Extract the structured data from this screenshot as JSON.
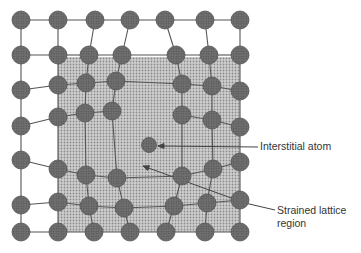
{
  "figure": {
    "labels": {
      "interstitial": "Interstitial atom",
      "strained_line1": "Strained lattice",
      "strained_line2": "region"
    },
    "colors": {
      "atom_fill": "#6a6a6a",
      "atom_stroke": "#555555",
      "bond": "#555555",
      "region_fill": "#c4c4c4",
      "region_dot": "#8a8a8a",
      "text": "#333333"
    },
    "atom_radius": 9,
    "region": {
      "x": 58,
      "y": 57,
      "w": 182,
      "h": 175
    },
    "rows": [
      [
        [
          21,
          20
        ],
        [
          58,
          20
        ],
        [
          95,
          20
        ],
        [
          130,
          20
        ],
        [
          165,
          20
        ],
        [
          205,
          20
        ],
        [
          240,
          20
        ]
      ],
      [
        [
          21,
          55
        ],
        [
          58,
          55
        ],
        [
          89,
          55
        ],
        [
          122,
          55
        ],
        [
          176,
          55
        ],
        [
          209,
          55
        ],
        [
          240,
          55
        ]
      ],
      [
        [
          21,
          90
        ],
        [
          58,
          85
        ],
        [
          86,
          83
        ],
        [
          116,
          81
        ],
        [
          182,
          84
        ],
        [
          212,
          86
        ],
        [
          240,
          91
        ]
      ],
      [
        [
          21,
          126
        ],
        [
          58,
          117
        ],
        [
          85,
          113
        ],
        [
          112,
          111
        ],
        [
          182,
          115
        ],
        [
          212,
          120
        ],
        [
          240,
          127
        ]
      ],
      [
        [
          21,
          160
        ],
        [
          58,
          169
        ],
        [
          86,
          175
        ],
        [
          117,
          178
        ],
        [
          182,
          176
        ],
        [
          213,
          169
        ],
        [
          240,
          162
        ]
      ],
      [
        [
          21,
          205
        ],
        [
          58,
          202
        ],
        [
          89,
          206
        ],
        [
          124,
          208
        ],
        [
          174,
          206
        ],
        [
          207,
          203
        ],
        [
          240,
          200
        ]
      ],
      [
        [
          21,
          232
        ],
        [
          58,
          232
        ],
        [
          94,
          232
        ],
        [
          130,
          232
        ],
        [
          166,
          232
        ],
        [
          205,
          232
        ],
        [
          240,
          232
        ]
      ]
    ],
    "interstitial_atom": [
      149,
      145
    ],
    "interstitial_pointer": {
      "from": [
        258,
        147
      ],
      "to": [
        158,
        146
      ]
    },
    "strained_pointer": {
      "from": [
        275,
        210
      ],
      "via": [
        245,
        203
      ],
      "to": [
        143,
        166
      ]
    }
  }
}
